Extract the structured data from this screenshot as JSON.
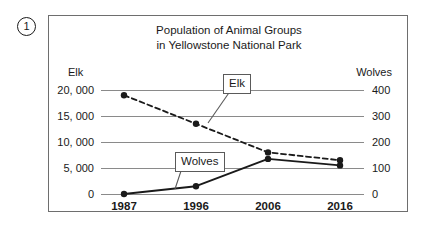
{
  "item_number": "1",
  "chart_data": {
    "type": "line",
    "title": "Population of Animal Groups in Yellowstone National Park",
    "title_lines": [
      "Population of Animal Groups",
      "in Yellowstone National Park"
    ],
    "xlabel": "",
    "categories": [
      "1987",
      "1996",
      "2006",
      "2016"
    ],
    "grid": true,
    "legend_position": "inline-callout",
    "left_axis": {
      "label": "Elk",
      "ticks": [
        "0",
        "5, 000",
        "10, 000",
        "15, 000",
        "20, 000"
      ],
      "tick_values": [
        0,
        5000,
        10000,
        15000,
        20000
      ],
      "ylim": [
        0,
        20000
      ]
    },
    "right_axis": {
      "label": "Wolves",
      "ticks": [
        "0",
        "100",
        "200",
        "300",
        "400"
      ],
      "tick_values": [
        0,
        100,
        200,
        300,
        400
      ],
      "ylim": [
        0,
        400
      ]
    },
    "series": [
      {
        "name": "Elk",
        "axis": "left",
        "style": "dashed",
        "color": "#1a1a1a",
        "values": [
          19000,
          13500,
          8000,
          6500
        ]
      },
      {
        "name": "Wolves",
        "axis": "right",
        "style": "solid",
        "color": "#1a1a1a",
        "values": [
          0,
          30,
          135,
          110
        ]
      }
    ],
    "annotations": [
      {
        "name": "Elk",
        "text": "Elk"
      },
      {
        "name": "Wolves",
        "text": "Wolves"
      }
    ]
  }
}
